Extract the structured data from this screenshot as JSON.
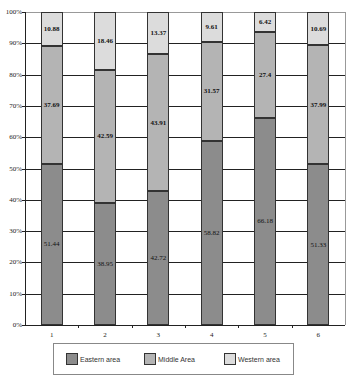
{
  "chart_data": {
    "type": "bar",
    "stacked": true,
    "percent": true,
    "title": "",
    "xlabel": "",
    "ylabel": "",
    "ylim": [
      0,
      100
    ],
    "yticks": [
      "0%",
      "10%",
      "20%",
      "30%",
      "40%",
      "50%",
      "60%",
      "70%",
      "80%",
      "90%",
      "100%"
    ],
    "categories": [
      "1",
      "2",
      "3",
      "4",
      "5",
      "6"
    ],
    "series": [
      {
        "name": "Eastern area",
        "color": "#8c8c8c",
        "values": [
          51.44,
          38.95,
          42.72,
          58.82,
          66.18,
          51.33
        ]
      },
      {
        "name": "Middle Area",
        "color": "#b4b4b4",
        "values": [
          37.69,
          42.59,
          43.91,
          31.57,
          27.4,
          37.99
        ]
      },
      {
        "name": "Western area",
        "color": "#dcdcdc",
        "values": [
          10.88,
          18.46,
          13.37,
          9.61,
          6.42,
          10.69
        ]
      }
    ],
    "grid": true,
    "legend_position": "bottom"
  }
}
